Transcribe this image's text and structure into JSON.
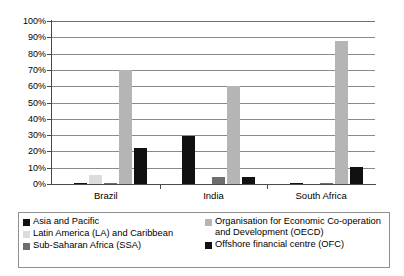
{
  "chart_data": {
    "type": "bar",
    "title": "",
    "subtitle": "",
    "xlabel": "",
    "ylabel": "",
    "categories": [
      "Brazil",
      "India",
      "South Africa"
    ],
    "ylim": [
      0,
      100
    ],
    "y_tick_labels": [
      "0%",
      "10%",
      "20%",
      "30%",
      "40%",
      "50%",
      "60%",
      "70%",
      "80%",
      "90%",
      "100%"
    ],
    "y_tick_values": [
      0,
      10,
      20,
      30,
      40,
      50,
      60,
      70,
      80,
      90,
      100
    ],
    "y_unit": "%",
    "grid": true,
    "legend_position": "bottom",
    "series": [
      {
        "name": "Asia and Pacific",
        "color": "#111111",
        "values": [
          0.5,
          29.5,
          0.5
        ]
      },
      {
        "name": "Latin America (LA) and Caribbean",
        "color": "#dcdcdc",
        "values": [
          5.5,
          0.0,
          0.0
        ]
      },
      {
        "name": "Sub-Saharan Africa (SSA)",
        "color": "#6e6e6e",
        "values": [
          0.5,
          4.0,
          0.5
        ]
      },
      {
        "name": "Organisation for Economic Co-operation and Development (OECD)",
        "color": "#b5b5b5",
        "values": [
          70.0,
          60.0,
          88.0
        ]
      },
      {
        "name": "Offshore financial centre (OFC)",
        "color": "#111111",
        "values": [
          22.0,
          4.0,
          10.5
        ]
      }
    ]
  },
  "legend": {
    "left_column": [
      {
        "label": "Asia and Pacific",
        "color": "#111111"
      },
      {
        "label": "Latin America (LA) and Caribbean",
        "color": "#dcdcdc"
      },
      {
        "label": "Sub-Saharan Africa (SSA)",
        "color": "#6e6e6e"
      }
    ],
    "right_column": [
      {
        "label": "Organisation for Economic Co-operation\nand Development (OECD)",
        "color": "#b5b5b5"
      },
      {
        "label": "Offshore financial centre (OFC)",
        "color": "#111111"
      }
    ]
  }
}
